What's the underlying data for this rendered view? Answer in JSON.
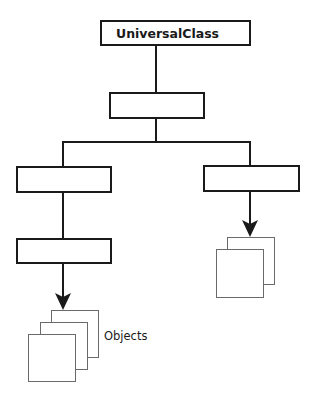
{
  "diagram": {
    "nodes": [
      {
        "id": "universal",
        "label": "UniversalClass",
        "x": 101,
        "y": 21,
        "w": 149,
        "h": 24
      },
      {
        "id": "middle",
        "label": "",
        "x": 110,
        "y": 93,
        "w": 94,
        "h": 25
      },
      {
        "id": "left-1",
        "label": "",
        "x": 17,
        "y": 167,
        "w": 94,
        "h": 25
      },
      {
        "id": "right-1",
        "label": "",
        "x": 204,
        "y": 166,
        "w": 95,
        "h": 25
      },
      {
        "id": "left-2",
        "label": "",
        "x": 17,
        "y": 239,
        "w": 94,
        "h": 24
      }
    ],
    "edges": [
      {
        "from": "universal",
        "to": "middle"
      },
      {
        "from": "middle",
        "to": "left-1"
      },
      {
        "from": "middle",
        "to": "right-1"
      },
      {
        "from": "left-1",
        "to": "left-2"
      }
    ],
    "instantiations": [
      {
        "from": "left-2",
        "to": "objects-left"
      },
      {
        "from": "right-1",
        "to": "objects-right"
      }
    ],
    "object_stacks": [
      {
        "id": "objects-left",
        "label": "Objects",
        "sheet_count": 3
      },
      {
        "id": "objects-right",
        "label": "",
        "sheet_count": 2
      }
    ],
    "colors": {
      "stroke": "#1a1a1a",
      "sheet_stroke": "#6a6a6a",
      "background": "#ffffff"
    }
  }
}
